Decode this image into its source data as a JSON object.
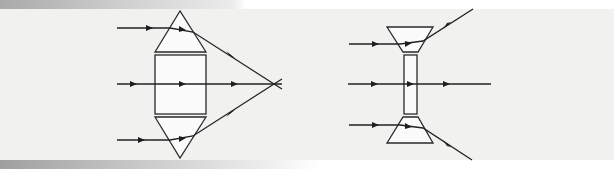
{
  "figure": {
    "colors": {
      "background": "#f1f1f0",
      "stroke": "#222222",
      "fill": "#fbfbfb"
    }
  },
  "converging_lens": {
    "components": [
      "top-prism-triangle",
      "center-rectangle-block",
      "bottom-prism-triangle"
    ],
    "rays": [
      {
        "label": "top-ray",
        "behavior": "bends down toward focal point"
      },
      {
        "label": "middle-ray",
        "behavior": "passes straight through"
      },
      {
        "label": "bottom-ray",
        "behavior": "bends up toward focal point"
      }
    ],
    "focal_point": "rays converge at a single point to the right"
  },
  "diverging_lens": {
    "components": [
      "top-inverted-trapezoid-prism",
      "center-thin-rectangle",
      "bottom-trapezoid-prism"
    ],
    "rays": [
      {
        "label": "top-ray",
        "behavior": "bends upward, diverging"
      },
      {
        "label": "middle-ray",
        "behavior": "passes straight through"
      },
      {
        "label": "bottom-ray",
        "behavior": "bends downward, diverging"
      }
    ]
  }
}
